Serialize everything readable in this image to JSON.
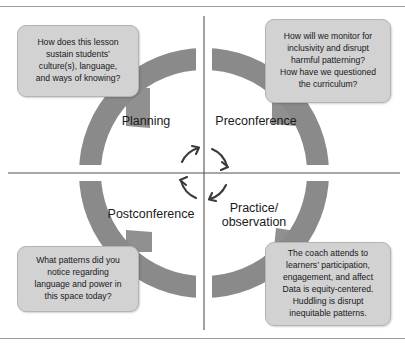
{
  "diagram": {
    "title_clipped": "",
    "type": "coaching-cycle-quadrant-diagram",
    "ring_color": "#8a8a8a",
    "callout_fill": "#d2d2d2",
    "callout_border": "#b4b4b4",
    "text_color": "#17181c",
    "axis_color": "#555555"
  },
  "quadrants": [
    {
      "id": "planning",
      "label": "Planning",
      "position": "top-left"
    },
    {
      "id": "preconference",
      "label": "Preconference",
      "position": "top-right"
    },
    {
      "id": "postconference",
      "label": "Postconference",
      "position": "bottom-left"
    },
    {
      "id": "practice",
      "label": "Practice/\nobservation",
      "position": "bottom-right"
    }
  ],
  "callouts": [
    {
      "id": "planning",
      "attached_to": "Planning",
      "text": "How does this lesson\nsustain students’\nculture(s), language,\nand ways of knowing?"
    },
    {
      "id": "preconference",
      "attached_to": "Preconference",
      "text": "How will we monitor for\ninclusivity and disrupt\nharmful patterning?\nHow have we questioned\nthe curriculum?"
    },
    {
      "id": "postconference",
      "attached_to": "Postconference",
      "text": "What patterns did you\nnotice regarding\nlanguage and power in\nthis space today?"
    },
    {
      "id": "practice",
      "attached_to": "Practice/observation",
      "text": "The coach attends to\nlearners’ participation,\nengagement, and affect\nData is equity-centered.\nHuddling is disrupt\ninequitable patterns."
    }
  ],
  "center": {
    "symbol": "circular-rotation-arrows",
    "arrow_count": 4,
    "direction": "clockwise"
  }
}
